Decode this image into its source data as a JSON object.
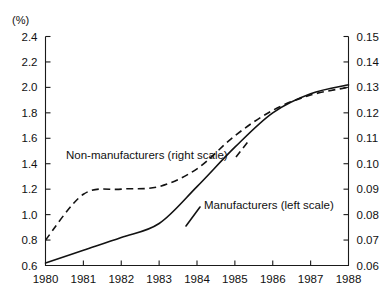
{
  "chart_data": {
    "type": "line",
    "title": "",
    "subtitle": "",
    "xlabel": "",
    "ylabel": "(%)",
    "y2label": "",
    "unit_label": "(%)",
    "grid": false,
    "legend_position": "inline-annotation",
    "x": [
      1980,
      1981,
      1982,
      1983,
      1984,
      1985,
      1986,
      1987,
      1988
    ],
    "xticklabels": [
      "1980",
      "1981",
      "1982",
      "1983",
      "1984",
      "1985",
      "1986",
      "1987",
      "1988"
    ],
    "xlim": [
      1980,
      1988
    ],
    "ylim": [
      0.6,
      2.4
    ],
    "yticks": [
      0.6,
      0.8,
      1.0,
      1.2,
      1.4,
      1.6,
      1.8,
      2.0,
      2.2,
      2.4
    ],
    "yticklabels": [
      "0.6",
      "0.8",
      "1.0",
      "1.2",
      "1.4",
      "1.6",
      "1.8",
      "2.0",
      "2.2",
      "2.4"
    ],
    "y2lim": [
      0.06,
      0.15
    ],
    "y2ticks": [
      0.06,
      0.07,
      0.08,
      0.09,
      0.1,
      0.11,
      0.12,
      0.13,
      0.14,
      0.15
    ],
    "y2ticklabels": [
      "0.06",
      "0.07",
      "0.08",
      "0.09",
      "0.10",
      "0.11",
      "0.12",
      "0.13",
      "0.14",
      "0.15"
    ],
    "series": [
      {
        "name": "Manufacturers (left scale)",
        "axis": "left",
        "style": "solid",
        "label_text": "Manufacturers (left scale)",
        "values": [
          0.62,
          0.72,
          0.82,
          0.93,
          1.22,
          1.53,
          1.8,
          1.95,
          2.02
        ]
      },
      {
        "name": "Non-manufacturers (right scale)",
        "axis": "right",
        "style": "dashed",
        "label_text": "Non-manufacturers (right scale)",
        "values": [
          0.07,
          0.088,
          0.09,
          0.091,
          0.098,
          0.111,
          0.121,
          0.127,
          0.13
        ]
      }
    ],
    "annotations": [
      {
        "text": "Non-manufacturers (right scale)",
        "series": "Non-manufacturers (right scale)"
      },
      {
        "text": "Manufacturers (left scale)",
        "series": "Manufacturers (left scale)"
      }
    ],
    "colors": {
      "line": "#121212",
      "axis": "#1a1a1a",
      "background": "#ffffff"
    }
  }
}
